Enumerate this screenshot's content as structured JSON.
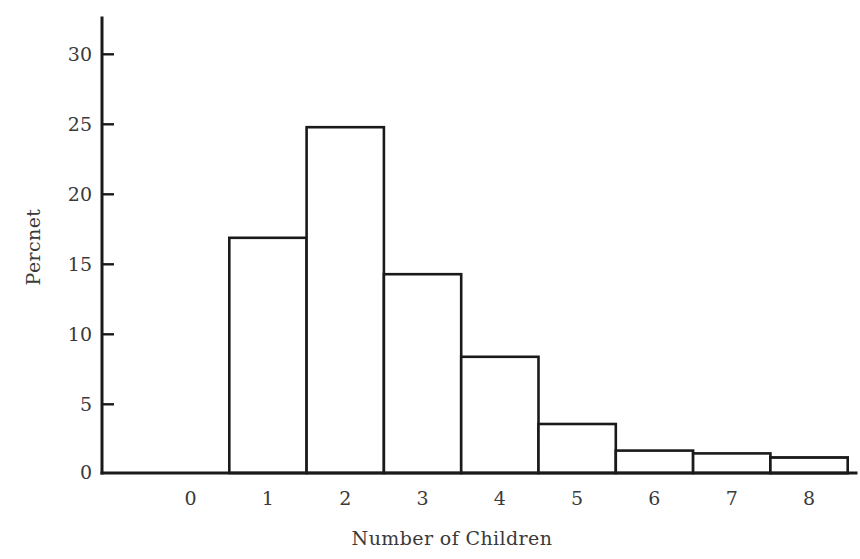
{
  "chart_data": {
    "type": "bar",
    "title": "",
    "subtitle": "",
    "xlabel": "Number of Children",
    "ylabel": "Percnet",
    "categories": [
      "0",
      "1",
      "2",
      "3",
      "4",
      "5",
      "6",
      "7",
      "8"
    ],
    "values": [
      27.6,
      16.8,
      24.7,
      14.2,
      8.3,
      3.5,
      1.6,
      1.4,
      1.1
    ],
    "series": [
      {
        "name": "Percnet",
        "values": [
          27.6,
          16.8,
          24.7,
          14.2,
          8.3,
          3.5,
          1.6,
          1.4,
          1.1
        ]
      }
    ],
    "xlim": [
      -0.5,
      8.5
    ],
    "ylim": [
      0,
      32
    ],
    "ytick_labels": [
      "0",
      "5",
      "10",
      "15",
      "20",
      "25",
      "30"
    ],
    "ytick_values": [
      0,
      5,
      10,
      15,
      20,
      25,
      30
    ],
    "xtick_labels": [
      "0",
      "1",
      "2",
      "3",
      "4",
      "5",
      "6",
      "7",
      "8"
    ],
    "grid": false,
    "legend": false,
    "legend_position": "none",
    "bar_fill_color": "#ffffff",
    "bar_edge_color": "#1a1a1a",
    "background_color": "#ffffff",
    "axis_color": "#1a1a1a",
    "text_color": "#3a3a3a"
  },
  "figure": {
    "y_axis_label": "Percnet",
    "x_axis_label": "Number of Children"
  }
}
